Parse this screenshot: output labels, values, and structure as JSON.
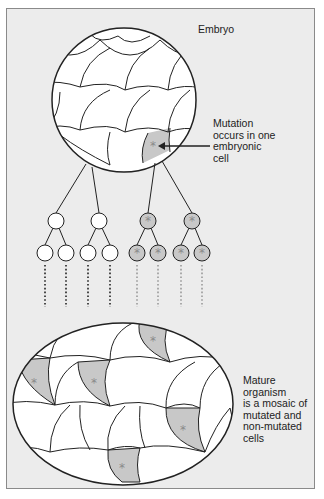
{
  "diagram": {
    "labels": {
      "embryo": "Embryo",
      "mutation": [
        "Mutation",
        "occurs in one",
        "embryonic",
        "cell"
      ],
      "mature": [
        "Mature",
        "organism",
        "is a mosaic of",
        "mutated and",
        "non-mutated",
        "cells"
      ]
    },
    "colors": {
      "background": "#ececec",
      "cell_fill": "#ffffff",
      "mutated_fill": "#c8c8c8",
      "star": "#8a8a8a",
      "stroke": "#222222"
    },
    "tree": {
      "level1": [
        {
          "x": 56,
          "mutated": false
        },
        {
          "x": 99,
          "mutated": false
        },
        {
          "x": 148,
          "mutated": true
        },
        {
          "x": 192,
          "mutated": true
        }
      ],
      "level2": [
        {
          "x": 45,
          "mutated": false
        },
        {
          "x": 66,
          "mutated": false
        },
        {
          "x": 88,
          "mutated": false
        },
        {
          "x": 110,
          "mutated": false
        },
        {
          "x": 137,
          "mutated": true
        },
        {
          "x": 158,
          "mutated": true
        },
        {
          "x": 181,
          "mutated": true
        },
        {
          "x": 202,
          "mutated": true
        }
      ]
    },
    "mutated_cells_in_mature": 6
  }
}
